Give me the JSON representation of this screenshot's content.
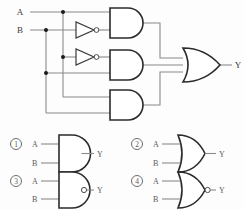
{
  "diagram": {
    "main_circuit": {
      "inputs": [
        {
          "name": "input-a",
          "label": "A"
        },
        {
          "name": "input-b",
          "label": "B"
        }
      ],
      "output": {
        "name": "output-y",
        "label": "Y"
      },
      "gates": [
        {
          "name": "inverter-1",
          "type": "NOT"
        },
        {
          "name": "inverter-2",
          "type": "NOT"
        },
        {
          "name": "and-gate-top",
          "type": "AND"
        },
        {
          "name": "and-gate-middle",
          "type": "AND"
        },
        {
          "name": "and-gate-bottom",
          "type": "AND"
        },
        {
          "name": "or-gate-output",
          "type": "OR"
        }
      ]
    },
    "options": [
      {
        "name": "option-1",
        "number": "1",
        "type": "AND",
        "input_a": "A",
        "input_b": "B",
        "output": "Y",
        "inverted": false
      },
      {
        "name": "option-2",
        "number": "2",
        "type": "OR",
        "input_a": "A",
        "input_b": "B",
        "output": "Y",
        "inverted": false
      },
      {
        "name": "option-3",
        "number": "3",
        "type": "NAND",
        "input_a": "A",
        "input_b": "B",
        "output": "Y",
        "inverted": true
      },
      {
        "name": "option-4",
        "number": "4",
        "type": "NOR",
        "input_a": "A",
        "input_b": "B",
        "output": "Y",
        "inverted": true
      }
    ]
  },
  "colors": {
    "wire": "#8a8a8a",
    "gate_stroke": "#2b2b2b",
    "background": "#fdfdfd",
    "text": "#3a3a3a"
  }
}
